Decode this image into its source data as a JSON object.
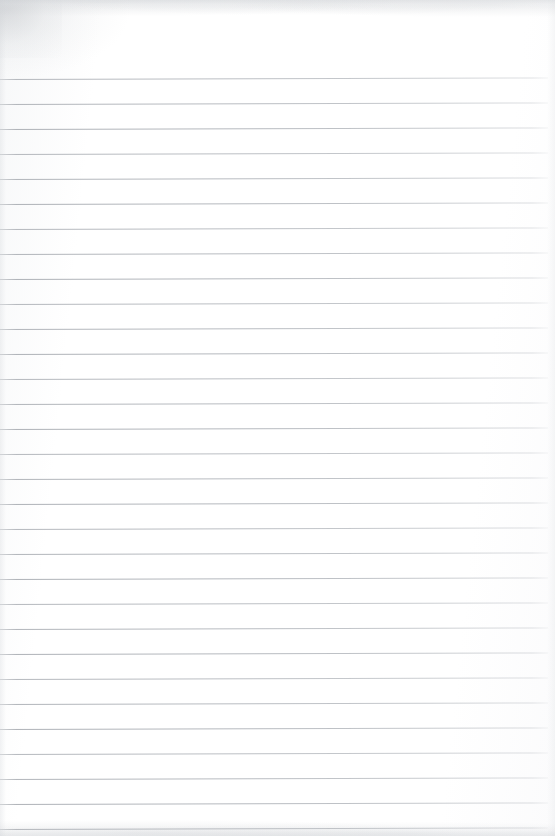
{
  "document": {
    "kind": "scanned-lined-notebook-page",
    "title": "Blank Lined Notebook Page",
    "page_width": 555,
    "page_height": 836,
    "background_color": "#ffffff",
    "paper_tint": "#fdfdfd",
    "content_text": "",
    "handwriting_present": "none",
    "printed_text_present": "none"
  },
  "ruling": {
    "line_color": "#acb0b6",
    "line_thickness_px": 1,
    "line_spacing_px": 25,
    "first_line_y": 79,
    "last_line_y": 829,
    "line_count": 31,
    "line_start_x": 0,
    "line_end_x": 548,
    "right_margin_px": 7,
    "top_margin_px": 79,
    "skew_degrees": -0.16,
    "line_y_positions": [
      79,
      104,
      129,
      154,
      179,
      204,
      229,
      254,
      279,
      304,
      329,
      354,
      379,
      404,
      429,
      454,
      479,
      504,
      529,
      554,
      579,
      604,
      629,
      654,
      679,
      704,
      729,
      754,
      779,
      804,
      829
    ]
  },
  "scan_artifacts": {
    "top_edge_shadow_color": "#cdd0d4",
    "bottom_edge_shadow_color": "#ced1d5",
    "corner_smudge_color": "#c1c4c8",
    "corner_smudge_position": "top-left"
  }
}
